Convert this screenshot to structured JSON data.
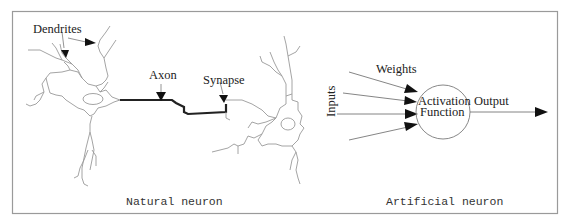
{
  "figure": {
    "panels": [
      {
        "id": "natural",
        "caption": "Natural neuron",
        "labels": {
          "dendrites": "Dendrites",
          "axon": "Axon",
          "synapse": "Synapse"
        }
      },
      {
        "id": "artificial",
        "caption": "Artificial neuron",
        "labels": {
          "weights": "Weights",
          "inputs": "Inputs",
          "activation_line1": "Activation",
          "activation_line2": "Function",
          "output": "Output"
        },
        "input_count": 4
      }
    ],
    "colors": {
      "frame": "#9a9a9a",
      "cell_outline": "#9a9a9a",
      "axon": "#222222",
      "arrowhead": "#111111",
      "text": "#222222"
    }
  }
}
